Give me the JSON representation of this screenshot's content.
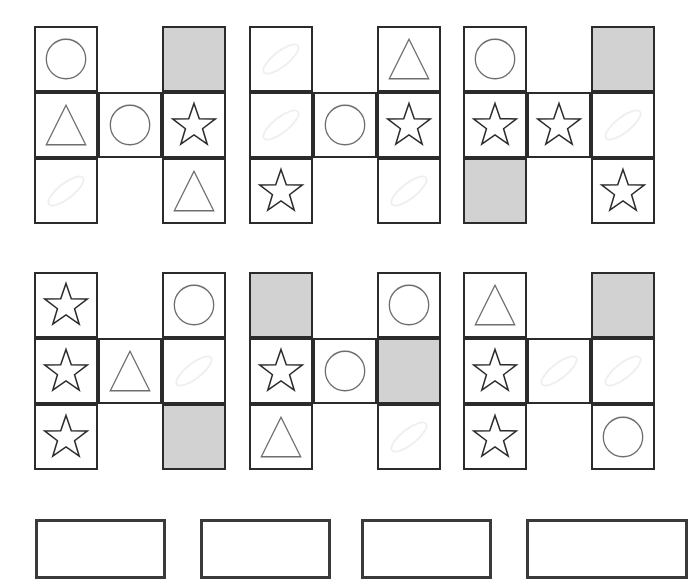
{
  "page": {
    "width": 688,
    "height": 533,
    "background_color": "#ffffff"
  },
  "legend": {
    "shape_names": [
      "circle",
      "triangle",
      "star",
      "faint-ellipse",
      "shaded-square",
      "blank"
    ],
    "stroke_color_dark": "#2b2b2b",
    "stroke_color_mid": "#6e6e6e",
    "stroke_color_faint": "#f0eeee",
    "shaded_fill": "#d2d2d2",
    "cell_border_color": "#2b2b2b"
  },
  "puzzles": [
    {
      "id": "puzzle-1",
      "row": 1,
      "col": 1,
      "x": 34,
      "y": 26,
      "grid": [
        [
          "circle",
          "blank",
          "shaded-square"
        ],
        [
          "triangle",
          "circle",
          "star"
        ],
        [
          "faint-ellipse",
          "blank",
          "triangle"
        ]
      ],
      "present": [
        [
          true,
          false,
          true
        ],
        [
          true,
          true,
          true
        ],
        [
          true,
          false,
          true
        ]
      ]
    },
    {
      "id": "puzzle-2",
      "row": 1,
      "col": 2,
      "x": 249,
      "y": 26,
      "grid": [
        [
          "faint-ellipse",
          "blank",
          "triangle"
        ],
        [
          "faint-ellipse",
          "circle",
          "star"
        ],
        [
          "star",
          "blank",
          "faint-ellipse"
        ]
      ],
      "present": [
        [
          true,
          false,
          true
        ],
        [
          true,
          true,
          true
        ],
        [
          true,
          false,
          true
        ]
      ]
    },
    {
      "id": "puzzle-3",
      "row": 1,
      "col": 3,
      "x": 463,
      "y": 26,
      "grid": [
        [
          "circle",
          "blank",
          "shaded-square"
        ],
        [
          "star",
          "star",
          "faint-ellipse"
        ],
        [
          "shaded-square",
          "blank",
          "star"
        ]
      ],
      "present": [
        [
          true,
          false,
          true
        ],
        [
          true,
          true,
          true
        ],
        [
          true,
          false,
          true
        ]
      ]
    },
    {
      "id": "puzzle-4",
      "row": 2,
      "col": 1,
      "x": 34,
      "y": 272,
      "grid": [
        [
          "star",
          "blank",
          "circle"
        ],
        [
          "star",
          "triangle",
          "faint-ellipse"
        ],
        [
          "star",
          "blank",
          "shaded-square"
        ]
      ],
      "present": [
        [
          true,
          false,
          true
        ],
        [
          true,
          true,
          true
        ],
        [
          true,
          false,
          true
        ]
      ]
    },
    {
      "id": "puzzle-5",
      "row": 2,
      "col": 2,
      "x": 249,
      "y": 272,
      "grid": [
        [
          "shaded-square",
          "blank",
          "circle"
        ],
        [
          "star",
          "circle",
          "shaded-square"
        ],
        [
          "triangle",
          "blank",
          "faint-ellipse"
        ]
      ],
      "present": [
        [
          true,
          false,
          true
        ],
        [
          true,
          true,
          true
        ],
        [
          true,
          false,
          true
        ]
      ]
    },
    {
      "id": "puzzle-6",
      "row": 2,
      "col": 3,
      "x": 463,
      "y": 272,
      "grid": [
        [
          "triangle",
          "blank",
          "shaded-square"
        ],
        [
          "star",
          "faint-ellipse",
          "faint-ellipse"
        ],
        [
          "star",
          "blank",
          "circle"
        ]
      ],
      "present": [
        [
          true,
          false,
          true
        ],
        [
          true,
          true,
          true
        ],
        [
          true,
          false,
          true
        ]
      ]
    }
  ],
  "answer_options": [
    {
      "id": "answer-option-1",
      "label": "",
      "x": 35,
      "y": 519,
      "width": 131
    },
    {
      "id": "answer-option-2",
      "label": "",
      "x": 200,
      "y": 519,
      "width": 131
    },
    {
      "id": "answer-option-3",
      "label": "",
      "x": 361,
      "y": 519,
      "width": 131
    },
    {
      "id": "answer-option-4",
      "label": "",
      "x": 526,
      "y": 519,
      "width": 162
    }
  ]
}
